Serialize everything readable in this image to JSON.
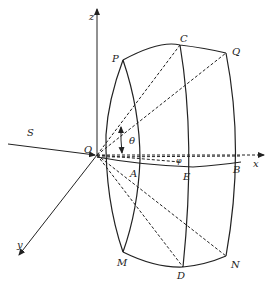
{
  "diagram": {
    "axes": {
      "x": "x",
      "y": "y",
      "z": "z"
    },
    "origin": "O",
    "source": "S",
    "angles": {
      "theta": "θ",
      "phi": "φ"
    },
    "points": {
      "P": "P",
      "C": "C",
      "Q": "Q",
      "A": "A",
      "E": "E",
      "B": "B",
      "M": "M",
      "D": "D",
      "N": "N"
    },
    "colors": {
      "line": "#222222",
      "background": "#ffffff"
    }
  }
}
